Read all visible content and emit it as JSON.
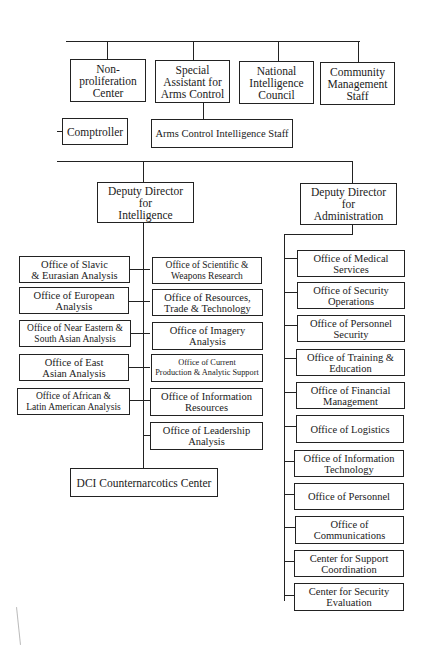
{
  "chart_title": "",
  "top_units": [
    {
      "label": "Non-\nproliferation\nCenter"
    },
    {
      "label": "Special\nAssistant for\nArms Control"
    },
    {
      "label": "National\nIntelligence\nCouncil"
    },
    {
      "label": "Community\nManagement\nStaff"
    }
  ],
  "comptroller": {
    "label": "Comptroller"
  },
  "arms_control_staff": {
    "label": "Arms Control Intelligence Staff"
  },
  "ddi": {
    "label": "Deputy Director\nfor\nIntelligence",
    "left_offices": [
      {
        "label": "Office of Slavic\n& Eurasian Analysis"
      },
      {
        "label": "Office of European\nAnalysis"
      },
      {
        "label": "Office of Near Eastern &\nSouth Asian Analysis"
      },
      {
        "label": "Office of East\nAsian Analysis"
      },
      {
        "label": "Office of African &\nLatin American Analysis"
      }
    ],
    "right_offices": [
      {
        "label": "Office of Scientific &\nWeapons Research"
      },
      {
        "label": "Office of Resources,\nTrade & Technology"
      },
      {
        "label": "Office of Imagery\nAnalysis"
      },
      {
        "label": "Office of Current\nProduction & Analytic Support"
      },
      {
        "label": "Office of Information\nResources"
      },
      {
        "label": "Office of Leadership\nAnalysis"
      }
    ],
    "center": {
      "label": "DCI Counternarcotics Center"
    }
  },
  "dda": {
    "label": "Deputy Director\nfor\nAdministration",
    "offices": [
      {
        "label": "Office of Medical\nServices"
      },
      {
        "label": "Office of Security\nOperations"
      },
      {
        "label": "Office of Personnel\nSecurity"
      },
      {
        "label": "Office of Training &\nEducation"
      },
      {
        "label": "Office of Financial\nManagement"
      },
      {
        "label": "Office of Logistics"
      },
      {
        "label": "Office of Information\nTechnology"
      },
      {
        "label": "Office of Personnel"
      },
      {
        "label": "Office of\nCommunications"
      },
      {
        "label": "Center for Support\nCoordination"
      },
      {
        "label": "Center for Security\nEvaluation"
      }
    ]
  }
}
